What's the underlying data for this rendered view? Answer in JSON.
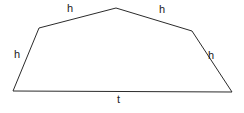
{
  "figure": {
    "kind": "geometry-diagram",
    "stroke_color": "#2b2b2b",
    "fill_color": "#ffffff",
    "stroke_width": 1,
    "background_color": "#ffffff",
    "width": 244,
    "height": 113,
    "vertices": [
      {
        "name": "bottom-left",
        "x": 13,
        "y": 91
      },
      {
        "name": "left-shoulder",
        "x": 39,
        "y": 28
      },
      {
        "name": "apex",
        "x": 116,
        "y": 8
      },
      {
        "name": "right-shoulder",
        "x": 192,
        "y": 31
      },
      {
        "name": "bottom-right",
        "x": 232,
        "y": 92
      }
    ],
    "path": "M 13 91 L 39 28 L 116 8 L 192 31 L 232 92 Z",
    "labels": {
      "h_top_left": "h",
      "h_top_right": "h",
      "h_left": "h",
      "h_right": "h",
      "t_base": "t"
    },
    "edges": [
      {
        "name": "left-slant",
        "label": "h",
        "from": "bottom-left",
        "to": "left-shoulder"
      },
      {
        "name": "upper-left-roof",
        "label": "h",
        "from": "left-shoulder",
        "to": "apex"
      },
      {
        "name": "upper-right-roof",
        "label": "h",
        "from": "apex",
        "to": "right-shoulder"
      },
      {
        "name": "right-slant",
        "label": "h",
        "from": "right-shoulder",
        "to": "bottom-right"
      },
      {
        "name": "base",
        "label": "t",
        "from": "bottom-right",
        "to": "bottom-left"
      }
    ]
  }
}
